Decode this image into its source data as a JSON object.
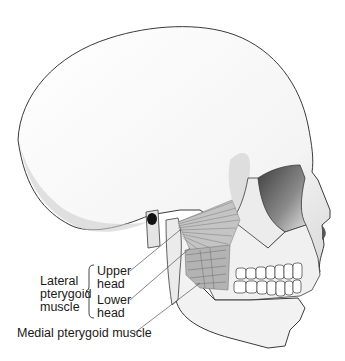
{
  "figure": {
    "labels": {
      "lateral_pterygoid": [
        "Lateral",
        "pterygoid",
        "muscle"
      ],
      "upper_head": [
        "Upper",
        "head"
      ],
      "lower_head": [
        "Lower",
        "head"
      ],
      "medial_pterygoid": "Medial pterygoid muscle"
    },
    "colors": {
      "outline": "#3a3a3a",
      "bone_shade": "#d8d8d8",
      "orbit_shadow": "#6e6e6e",
      "muscle": "#b8b8b8",
      "ear_canal": "#111111",
      "background": "#ffffff"
    }
  }
}
